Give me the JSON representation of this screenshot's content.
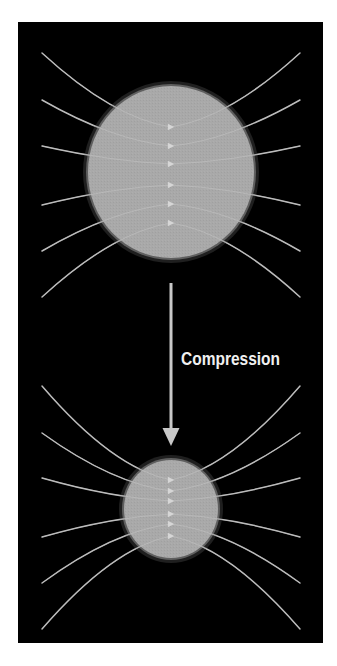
{
  "diagram": {
    "label": "Compression",
    "colors": {
      "background": "#ffffff",
      "panel": "#000000",
      "sphere": "#a9a9a9",
      "field_line": "#b4b4b4",
      "arrow": "#c8c8c8",
      "label": "#f0f0f0"
    },
    "panel": {
      "x": 18,
      "y": 22,
      "width": 305,
      "height": 621
    },
    "top_sphere": {
      "cx": 171,
      "cy": 172,
      "rx": 83,
      "ry": 86,
      "field_lines": [
        {
          "left_y": 53,
          "center_y": 127
        },
        {
          "left_y": 100,
          "center_y": 146
        },
        {
          "left_y": 146,
          "center_y": 164
        },
        {
          "left_y": 205,
          "center_y": 185
        },
        {
          "left_y": 251,
          "center_y": 204
        },
        {
          "left_y": 297,
          "center_y": 223
        }
      ]
    },
    "compression_arrow": {
      "x": 171,
      "y_start": 283,
      "y_end": 446
    },
    "bottom_sphere": {
      "cx": 171,
      "cy": 509,
      "rx": 47,
      "ry": 49,
      "field_lines": [
        {
          "left_y": 386,
          "center_y": 480
        },
        {
          "left_y": 433,
          "center_y": 491
        },
        {
          "left_y": 478,
          "center_y": 501
        },
        {
          "left_y": 537,
          "center_y": 514
        },
        {
          "left_y": 583,
          "center_y": 524
        },
        {
          "left_y": 629,
          "center_y": 536
        }
      ]
    },
    "line_x": {
      "left": 42,
      "right": 300
    }
  }
}
